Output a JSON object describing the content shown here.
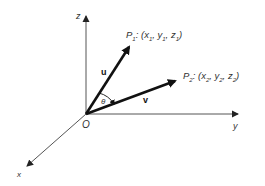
{
  "diagram": {
    "origin": {
      "label": "O",
      "x": 86,
      "y": 114
    },
    "axes": {
      "z": {
        "label": "z",
        "end": [
          86,
          14
        ]
      },
      "y": {
        "label": "y",
        "end": [
          240,
          114
        ]
      },
      "x": {
        "label": "x",
        "end": [
          25,
          168
        ]
      }
    },
    "vectors": {
      "u": {
        "label": "u",
        "end": [
          131,
          44
        ]
      },
      "v": {
        "label": "v",
        "end": [
          178,
          80
        ]
      }
    },
    "points": {
      "p1": {
        "name": "P",
        "sub": "1",
        "coords": ": (x",
        "x_sub": "1",
        "sep1": ", y",
        "y_sub": "1",
        "sep2": ", z",
        "z_sub": "1",
        "close": ")"
      },
      "p2": {
        "name": "P",
        "sub": "2",
        "coords": ": (x",
        "x_sub": "2",
        "sep1": ", y",
        "y_sub": "2",
        "sep2": ", z",
        "z_sub": "2",
        "close": ")"
      }
    },
    "angle": {
      "label": "θ"
    },
    "colors": {
      "axis": "#555555",
      "vector": "#111111",
      "text": "#333333",
      "background": "#ffffff"
    }
  }
}
